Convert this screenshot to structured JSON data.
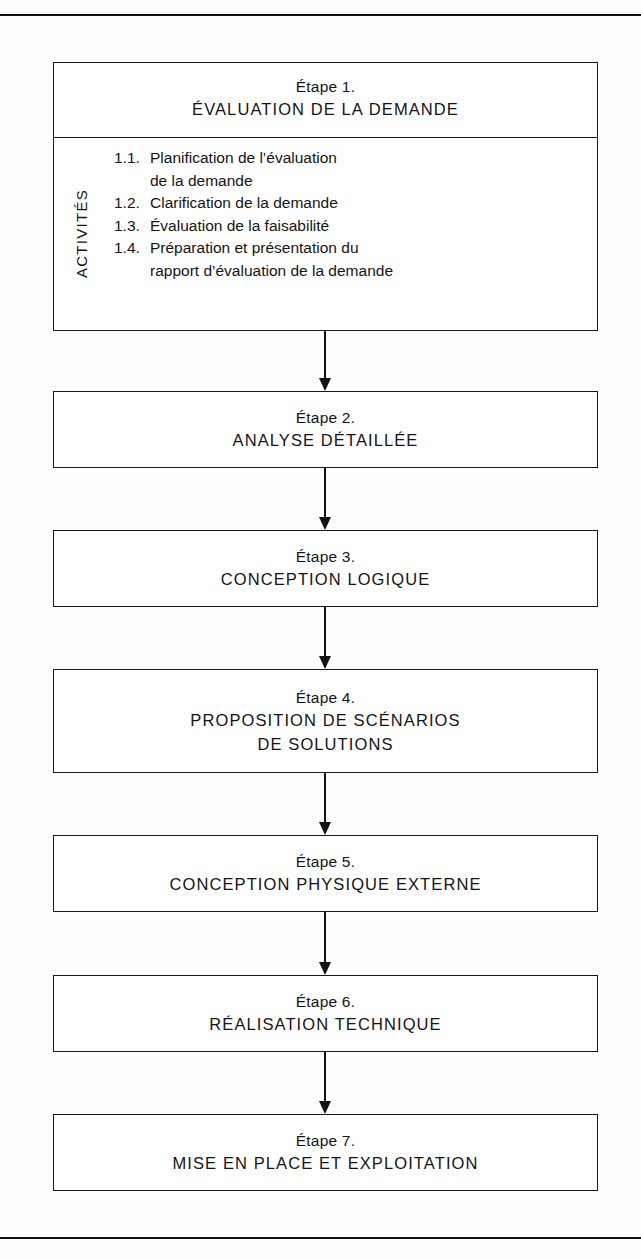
{
  "diagram": {
    "activities_label": "ACTIVITÉS",
    "steps": [
      {
        "number": "Étape 1.",
        "name": "ÉVALUATION DE LA DEMANDE",
        "activities": [
          {
            "num": "1.1.",
            "text": "Planification de l’évaluation",
            "cont": "de la demande"
          },
          {
            "num": "1.2.",
            "text": "Clarification de la demande",
            "cont": ""
          },
          {
            "num": "1.3.",
            "text": "Évaluation de la faisabilité",
            "cont": ""
          },
          {
            "num": "1.4.",
            "text": "Préparation et présentation du",
            "cont": "rapport d’évaluation de la demande"
          }
        ]
      },
      {
        "number": "Étape 2.",
        "name": "ANALYSE DÉTAILLÉE"
      },
      {
        "number": "Étape 3.",
        "name": "CONCEPTION LOGIQUE"
      },
      {
        "number": "Étape 4.",
        "name": "PROPOSITION DE SCÉNARIOS",
        "name2": "DE SOLUTIONS"
      },
      {
        "number": "Étape 5.",
        "name": "CONCEPTION PHYSIQUE EXTERNE"
      },
      {
        "number": "Étape 6.",
        "name": "RÉALISATION TECHNIQUE"
      },
      {
        "number": "Étape 7.",
        "name": "MISE EN PLACE ET EXPLOITATION"
      }
    ],
    "colors": {
      "ink": "#1a1a1a",
      "paper": "#ffffff"
    }
  }
}
